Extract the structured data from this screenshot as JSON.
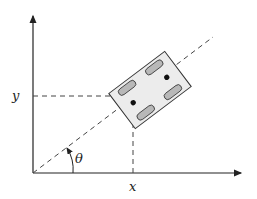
{
  "diagram": {
    "type": "robot-pose-coordinate-frame",
    "labels": {
      "x_axis": "x",
      "y_axis": "y",
      "angle": "θ"
    },
    "colors": {
      "stroke": "#222222",
      "body_fill": "#ececec",
      "wheel_fill": "#b8b8b8"
    }
  }
}
